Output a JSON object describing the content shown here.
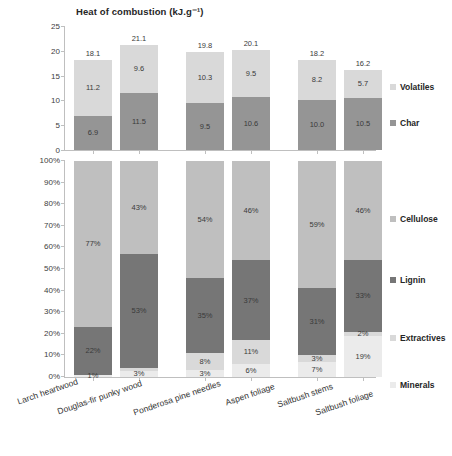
{
  "chart_data": [
    {
      "type": "bar",
      "title": "Heat of combustion (kJ.g⁻¹)",
      "xlabel": "",
      "ylabel": "",
      "ylim": [
        0,
        25
      ],
      "yticks": [
        "0",
        "5",
        "10",
        "15",
        "20",
        "25"
      ],
      "grid": false,
      "stacked": true,
      "legend_position": "right",
      "categories": [
        "Larch heartwood",
        "Douglas-fir punky wood",
        "Ponderosa pine needles",
        "Aspen foliage",
        "Saltbush stems",
        "Saltbush foliage"
      ],
      "series": [
        {
          "name": "Volatiles",
          "color": "#d9d9d9",
          "values": [
            11.2,
            9.6,
            10.3,
            9.5,
            8.2,
            5.7
          ]
        },
        {
          "name": "Char",
          "color": "#959595",
          "values": [
            6.9,
            11.5,
            9.5,
            10.6,
            10.0,
            10.5
          ]
        }
      ],
      "totals": [
        18.1,
        21.1,
        19.8,
        20.1,
        18.2,
        16.2
      ],
      "total_labels": [
        "18.1",
        "21.1",
        "19.8",
        "20.1",
        "18.2",
        "16.2"
      ],
      "value_labels": {
        "Volatiles": [
          "11.2",
          "9.6",
          "10.3",
          "9.5",
          "8.2",
          "5.7"
        ],
        "Char": [
          "6.9",
          "11.5",
          "9.5",
          "10.6",
          "10.0",
          "10.5"
        ]
      }
    },
    {
      "type": "bar",
      "title": "",
      "xlabel": "",
      "ylabel": "",
      "ylim": [
        0,
        100
      ],
      "yticks": [
        "0%",
        "10%",
        "20%",
        "30%",
        "40%",
        "50%",
        "60%",
        "70%",
        "80%",
        "90%",
        "100%"
      ],
      "grid": false,
      "stacked": true,
      "stack_normalized": true,
      "legend_position": "right",
      "categories": [
        "Larch heartwood",
        "Douglas-fir punky wood",
        "Ponderosa pine needles",
        "Aspen foliage",
        "Saltbush stems",
        "Saltbush foliage"
      ],
      "series": [
        {
          "name": "Cellulose",
          "color": "#bfbfbf",
          "values": [
            77,
            43,
            54,
            46,
            59,
            46
          ]
        },
        {
          "name": "Lignin",
          "color": "#767676",
          "values": [
            22,
            53,
            35,
            37,
            31,
            33
          ]
        },
        {
          "name": "Extractives",
          "color": "#d9d9d9",
          "values": [
            0,
            1,
            8,
            11,
            3,
            2
          ]
        },
        {
          "name": "Minerals",
          "color": "#ebebeb",
          "values": [
            1,
            3,
            3,
            6,
            7,
            19
          ]
        }
      ],
      "value_labels": {
        "Cellulose": [
          "77%",
          "43%",
          "54%",
          "46%",
          "59%",
          "46%"
        ],
        "Lignin": [
          "22%",
          "53%",
          "35%",
          "37%",
          "31%",
          "33%"
        ],
        "Extractives": [
          "",
          "",
          "8%",
          "11%",
          "3%",
          "2%"
        ],
        "Minerals": [
          "1%",
          "3%",
          "3%",
          "6%",
          "7%",
          "19%"
        ]
      }
    }
  ],
  "top": {
    "title": "Heat of combustion (kJ.g⁻¹)",
    "yticks": [
      "25",
      "20",
      "15",
      "10",
      "5",
      "0"
    ],
    "legend": [
      {
        "label": "Volatiles",
        "color": "#d9d9d9"
      },
      {
        "label": "Char",
        "color": "#959595"
      }
    ],
    "bars": [
      {
        "total": "18.1",
        "volatiles": "11.2",
        "char": "6.9"
      },
      {
        "total": "21.1",
        "volatiles": "9.6",
        "char": "11.5"
      },
      {
        "total": "19.8",
        "volatiles": "10.3",
        "char": "9.5"
      },
      {
        "total": "20.1",
        "volatiles": "9.5",
        "char": "10.6"
      },
      {
        "total": "18.2",
        "volatiles": "8.2",
        "char": "10.0"
      },
      {
        "total": "16.2",
        "volatiles": "5.7",
        "char": "10.5"
      }
    ]
  },
  "bottom": {
    "yticks": [
      "100%",
      "90%",
      "80%",
      "70%",
      "60%",
      "50%",
      "40%",
      "30%",
      "20%",
      "10%",
      "0%"
    ],
    "legend": [
      {
        "label": "Cellulose",
        "color": "#bfbfbf"
      },
      {
        "label": "Lignin",
        "color": "#767676"
      },
      {
        "label": "Extractives",
        "color": "#d9d9d9"
      },
      {
        "label": "Minerals",
        "color": "#ebebeb"
      }
    ],
    "bars": [
      {
        "cellulose": "77%",
        "lignin": "22%",
        "extractives": "",
        "minerals": "1%"
      },
      {
        "cellulose": "43%",
        "lignin": "53%",
        "extractives": "",
        "minerals": "3%"
      },
      {
        "cellulose": "54%",
        "lignin": "35%",
        "extractives": "8%",
        "minerals": "3%"
      },
      {
        "cellulose": "46%",
        "lignin": "37%",
        "extractives": "11%",
        "minerals": "6%"
      },
      {
        "cellulose": "59%",
        "lignin": "31%",
        "extractives": "3%",
        "minerals": "7%"
      },
      {
        "cellulose": "46%",
        "lignin": "33%",
        "extractives": "2%",
        "minerals": "19%"
      }
    ]
  },
  "xaxis": {
    "labels": [
      "Larch heartwood",
      "Douglas-fir punky wood",
      "Ponderosa pine needles",
      "Aspen foliage",
      "Saltbush stems",
      "Saltbush foliage"
    ]
  }
}
